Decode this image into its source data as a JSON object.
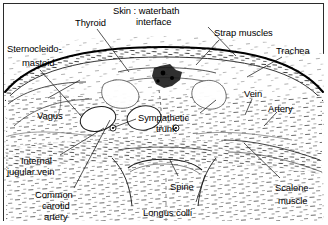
{
  "figure": {
    "kind": "labeled-anatomical-ultrasound-cross-section",
    "region": "neck transverse section",
    "border_color": "#2b2b2b",
    "background_color": "#ffffff",
    "ink_color": "#000000",
    "width": 328,
    "height": 225
  },
  "labels": [
    {
      "id": "thyroid",
      "text": "Thyroid",
      "x": 75,
      "y": 18,
      "align": "left"
    },
    {
      "id": "skin_waterbath",
      "text": "Skin : waterbath",
      "x": 113,
      "y": 6,
      "align": "left"
    },
    {
      "id": "skin_waterbath_2",
      "text": "interface",
      "x": 136,
      "y": 17,
      "align": "left"
    },
    {
      "id": "strap_muscles",
      "text": "Strap muscles",
      "x": 214,
      "y": 28,
      "align": "left"
    },
    {
      "id": "trachea",
      "text": "Trachea",
      "x": 276,
      "y": 46,
      "align": "left"
    },
    {
      "id": "sternocleidomastoid",
      "text": "Sternocleido-",
      "x": 7,
      "y": 44,
      "align": "left"
    },
    {
      "id": "sternocleidomastoid_2",
      "text": "mastoid",
      "x": 22,
      "y": 58,
      "align": "left"
    },
    {
      "id": "vagus",
      "text": "Vagus",
      "x": 37,
      "y": 111,
      "align": "left"
    },
    {
      "id": "sympathetic_trunk",
      "text": "Sympathetic",
      "x": 138,
      "y": 113,
      "align": "left"
    },
    {
      "id": "sympathetic_trunk_2",
      "text": "trunk",
      "x": 156,
      "y": 124,
      "align": "left"
    },
    {
      "id": "vein",
      "text": "Vein",
      "x": 244,
      "y": 89,
      "align": "left"
    },
    {
      "id": "artery",
      "text": "Artery",
      "x": 268,
      "y": 104,
      "align": "left"
    },
    {
      "id": "internal_jugular_vein",
      "text": "Internal",
      "x": 21,
      "y": 156,
      "align": "left"
    },
    {
      "id": "internal_jugular_vein_2",
      "text": "jugular vein",
      "x": 7,
      "y": 167,
      "align": "left"
    },
    {
      "id": "common_carotid_artery",
      "text": "Common",
      "x": 35,
      "y": 190,
      "align": "left"
    },
    {
      "id": "common_carotid_artery_2",
      "text": "carotid",
      "x": 42,
      "y": 201,
      "align": "left"
    },
    {
      "id": "common_carotid_artery_3",
      "text": "artery",
      "x": 44,
      "y": 212,
      "align": "left"
    },
    {
      "id": "spine",
      "text": "Spine",
      "x": 170,
      "y": 182,
      "align": "left"
    },
    {
      "id": "longus_colli",
      "text": "Longus colli",
      "x": 143,
      "y": 208,
      "align": "left"
    },
    {
      "id": "scalene_muscle",
      "text": "Scalene",
      "x": 275,
      "y": 183,
      "align": "left"
    },
    {
      "id": "scalene_muscle_2",
      "text": "muscle",
      "x": 278,
      "y": 196,
      "align": "left"
    }
  ],
  "leader_lines": [
    {
      "id": "leader-thyroid",
      "from": [
        97,
        29
      ],
      "to": [
        129,
        72
      ]
    },
    {
      "id": "leader-skin",
      "from": [
        208,
        27
      ],
      "to": [
        236,
        56
      ]
    },
    {
      "id": "leader-strap",
      "from": [
        219,
        40
      ],
      "to": [
        196,
        65
      ]
    },
    {
      "id": "leader-trachea",
      "from": [
        282,
        57
      ],
      "to": [
        247,
        77
      ]
    },
    {
      "id": "leader-scm",
      "from": [
        40,
        70
      ],
      "to": [
        82,
        117
      ]
    },
    {
      "id": "leader-scm-cross",
      "from": [
        48,
        98
      ],
      "to": [
        80,
        80
      ]
    },
    {
      "id": "leader-vein",
      "from": [
        252,
        99
      ],
      "to": [
        245,
        115
      ]
    },
    {
      "id": "leader-artery",
      "from": [
        277,
        112
      ],
      "to": [
        264,
        126
      ]
    },
    {
      "id": "leader-ijv",
      "from": [
        60,
        155
      ],
      "to": [
        104,
        128
      ]
    },
    {
      "id": "leader-cca",
      "from": [
        74,
        188
      ],
      "to": [
        110,
        120
      ]
    },
    {
      "id": "leader-sympathetic",
      "from": [
        136,
        119
      ],
      "to": [
        112,
        128
      ]
    },
    {
      "id": "leader-sympathetic-right",
      "from": [
        200,
        113
      ],
      "to": [
        216,
        100
      ]
    },
    {
      "id": "leader-scalene",
      "from": [
        280,
        178
      ],
      "to": [
        244,
        143
      ]
    },
    {
      "id": "leader-spine",
      "from": [
        178,
        176
      ],
      "to": [
        170,
        160
      ]
    },
    {
      "id": "leader-longus",
      "from": [
        196,
        202
      ],
      "to": [
        205,
        175
      ]
    }
  ],
  "structures": [
    {
      "id": "skin-waterbath-interface",
      "desc": "bold dark arc across upper field"
    },
    {
      "id": "subcutaneous-band",
      "desc": "speckled band beneath skin arc"
    },
    {
      "id": "thyroid-lobes",
      "desc": "paired lobes flanking midline"
    },
    {
      "id": "trachea-shadow",
      "desc": "dense dark cluster at midline"
    },
    {
      "id": "internal-jugular-vein",
      "desc": "left oval anechoic vessel"
    },
    {
      "id": "common-carotid-artery",
      "desc": "right oval anechoic vessel"
    },
    {
      "id": "vagus-nerve",
      "desc": "small circle between vessels"
    },
    {
      "id": "sympathetic-trunk",
      "desc": "small circle deep to vessels"
    },
    {
      "id": "spine-vertebral-body",
      "desc": "lower midline curved body with shadow"
    },
    {
      "id": "longus-colli",
      "desc": "prevertebral muscle outline"
    },
    {
      "id": "scalene-muscle",
      "desc": "lateral muscle mass right"
    },
    {
      "id": "strap-muscles",
      "desc": "thin anterior midline muscle layer"
    }
  ]
}
